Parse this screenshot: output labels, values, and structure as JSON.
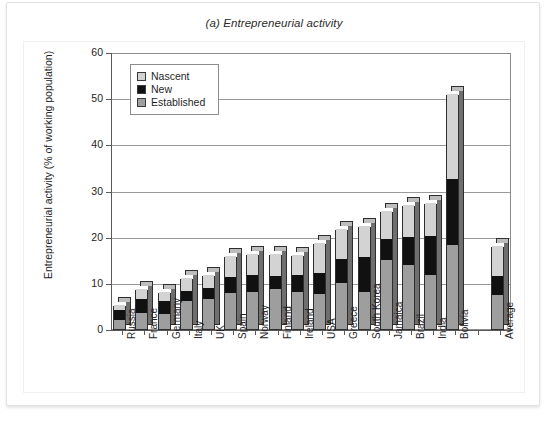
{
  "figure": {
    "title": "(a) Entrepreneurial activity"
  },
  "legend": {
    "items": [
      {
        "label": "Nascent",
        "color": "#d3d3d3"
      },
      {
        "label": "New",
        "color": "#111111"
      },
      {
        "label": "Established",
        "color": "#9e9e9e"
      }
    ]
  },
  "chart_data": {
    "type": "bar",
    "subtype": "stacked-column",
    "title": "(a) Entrepreneurial activity",
    "xlabel": "",
    "ylabel": "Entrepreneurial activity (% of working population)",
    "ylim": [
      0,
      60
    ],
    "ytick_step": 10,
    "yticks": [
      0,
      10,
      20,
      30,
      40,
      50,
      60
    ],
    "grid": true,
    "legend_position": "top-left",
    "legend_entries": [
      "Nascent",
      "New",
      "Established"
    ],
    "categories": [
      "Russia",
      "France",
      "Germany",
      "Italy",
      "UK",
      "Spain",
      "Norway",
      "Finland",
      "Ireland",
      "USA",
      "Greece",
      "South Korea",
      "Jamaica",
      "Brazil",
      "India",
      "Bolivia",
      "",
      "Average"
    ],
    "series": [
      {
        "name": "Established",
        "color": "#9e9e9e",
        "values": [
          2.0,
          3.4,
          3.2,
          6.0,
          6.6,
          7.7,
          8.0,
          8.7,
          8.0,
          7.6,
          10.0,
          8.0,
          15.0,
          13.8,
          11.8,
          18.2,
          null,
          7.3
        ]
      },
      {
        "name": "New",
        "color": "#111111",
        "values": [
          2.2,
          3.0,
          2.8,
          2.2,
          2.3,
          3.6,
          3.6,
          2.8,
          3.6,
          4.6,
          5.2,
          7.6,
          4.6,
          6.2,
          8.4,
          14.2,
          null,
          4.1
        ]
      },
      {
        "name": "Nascent",
        "color": "#d3d3d3",
        "values": [
          0.9,
          2.2,
          2.0,
          2.8,
          2.8,
          4.5,
          4.6,
          4.7,
          4.4,
          6.4,
          6.4,
          6.7,
          6.0,
          6.8,
          7.0,
          18.6,
          null,
          6.5
        ]
      }
    ],
    "totals": [
      5.1,
      8.6,
      8.0,
      11.0,
      11.7,
      15.8,
      16.2,
      16.2,
      16.0,
      18.6,
      21.6,
      22.3,
      25.6,
      26.8,
      27.2,
      51.0,
      null,
      17.9
    ]
  }
}
